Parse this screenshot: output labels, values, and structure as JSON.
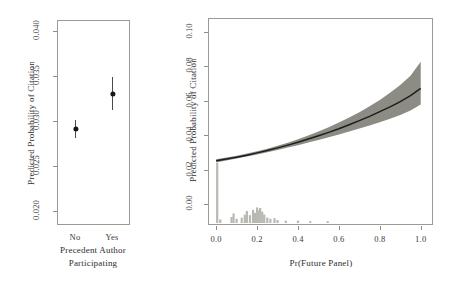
{
  "figure": {
    "panels": [
      {
        "id": "left",
        "type": "pointrange",
        "ylabel": "Predicted Probability of Citation",
        "xlabel_line1": "Precedent Author",
        "xlabel_line2": "Participating",
        "yticks": [
          "0.020",
          "0.025",
          "0.030",
          "0.035",
          "0.040"
        ],
        "ytick_values": [
          0.02,
          0.025,
          0.03,
          0.035,
          0.04
        ],
        "ylim": [
          0.0185,
          0.0412
        ],
        "categories": [
          "No",
          "Yes"
        ]
      },
      {
        "id": "right",
        "type": "line",
        "ylabel": "Predicted Probability of Citation",
        "xlabel": "Pr(Future Panel)",
        "yticks": [
          "0.00",
          "0.02",
          "0.04",
          "0.06",
          "0.08",
          "0.10"
        ],
        "ytick_values": [
          0.0,
          0.02,
          0.04,
          0.06,
          0.08,
          0.1
        ],
        "xticks": [
          "0.0",
          "0.2",
          "0.4",
          "0.6",
          "0.8",
          "1.0"
        ],
        "xtick_values": [
          0.0,
          0.2,
          0.4,
          0.6,
          0.8,
          1.0
        ],
        "ylim": [
          -0.012,
          0.108
        ],
        "xlim": [
          -0.04,
          1.06
        ]
      }
    ]
  },
  "chart_data": [
    {
      "type": "scatter",
      "subtype": "point-range-estimate",
      "title": "",
      "xlabel": "Precedent Author Participating",
      "ylabel": "Predicted Probability of Citation",
      "categories": [
        "No",
        "Yes"
      ],
      "values": [
        0.0291,
        0.033
      ],
      "ci_lower": [
        0.0281,
        0.0312
      ],
      "ci_upper": [
        0.0301,
        0.0349
      ],
      "ylim": [
        0.02,
        0.04
      ],
      "yticks": [
        0.02,
        0.025,
        0.03,
        0.035,
        0.04
      ],
      "grid": false,
      "legend": null
    },
    {
      "type": "line",
      "subtype": "fitted-curve-with-confidence-band-and-rug",
      "title": "",
      "xlabel": "Pr(Future Panel)",
      "ylabel": "Predicted Probability of Citation",
      "xlim": [
        0.0,
        1.0
      ],
      "ylim": [
        0.0,
        0.1
      ],
      "xticks": [
        0.0,
        0.2,
        0.4,
        0.6,
        0.8,
        1.0
      ],
      "yticks": [
        0.0,
        0.02,
        0.04,
        0.06,
        0.08,
        0.1
      ],
      "grid": false,
      "legend": null,
      "x": [
        0.0,
        0.05,
        0.1,
        0.15,
        0.2,
        0.25,
        0.3,
        0.35,
        0.4,
        0.45,
        0.5,
        0.55,
        0.6,
        0.65,
        0.7,
        0.75,
        0.8,
        0.85,
        0.9,
        0.95,
        1.0
      ],
      "series": [
        {
          "name": "Predicted probability",
          "values": [
            0.0252,
            0.0262,
            0.0273,
            0.0285,
            0.0298,
            0.0312,
            0.0327,
            0.0343,
            0.036,
            0.0378,
            0.0397,
            0.0417,
            0.0438,
            0.0461,
            0.0485,
            0.051,
            0.0537,
            0.0565,
            0.0595,
            0.063,
            0.0672
          ]
        },
        {
          "name": "95% CI lower",
          "values": [
            0.0243,
            0.0254,
            0.0265,
            0.0277,
            0.0289,
            0.0302,
            0.0315,
            0.0329,
            0.0343,
            0.0358,
            0.0373,
            0.0389,
            0.0405,
            0.0422,
            0.0439,
            0.0457,
            0.0476,
            0.0496,
            0.0518,
            0.0544,
            0.0579
          ]
        },
        {
          "name": "95% CI upper",
          "values": [
            0.0261,
            0.0271,
            0.0282,
            0.0294,
            0.0307,
            0.0322,
            0.0339,
            0.0357,
            0.0377,
            0.0399,
            0.0422,
            0.0447,
            0.0474,
            0.0503,
            0.0534,
            0.0568,
            0.0605,
            0.0646,
            0.0691,
            0.0745,
            0.0827
          ]
        }
      ],
      "rug_histogram": {
        "description": "distribution of Pr(Future Panel) drawn along the bottom margin",
        "bin_centers": [
          0.005,
          0.02,
          0.075,
          0.085,
          0.1,
          0.125,
          0.14,
          0.15,
          0.165,
          0.18,
          0.19,
          0.2,
          0.205,
          0.215,
          0.225,
          0.235,
          0.25,
          0.265,
          0.285,
          0.3,
          0.34,
          0.4,
          0.46,
          0.545
        ],
        "bin_heights": [
          1.0,
          0.06,
          0.1,
          0.16,
          0.07,
          0.09,
          0.14,
          0.2,
          0.13,
          0.22,
          0.17,
          0.26,
          0.21,
          0.25,
          0.19,
          0.14,
          0.09,
          0.07,
          0.08,
          0.05,
          0.04,
          0.04,
          0.03,
          0.03
        ]
      }
    }
  ],
  "colors": {
    "band": "#8c8c84",
    "curve": "#1d1d1d",
    "point": "#161616",
    "frame": "#9a9a96",
    "rug": "#b9b9b2",
    "text": "#2e2e2e"
  }
}
